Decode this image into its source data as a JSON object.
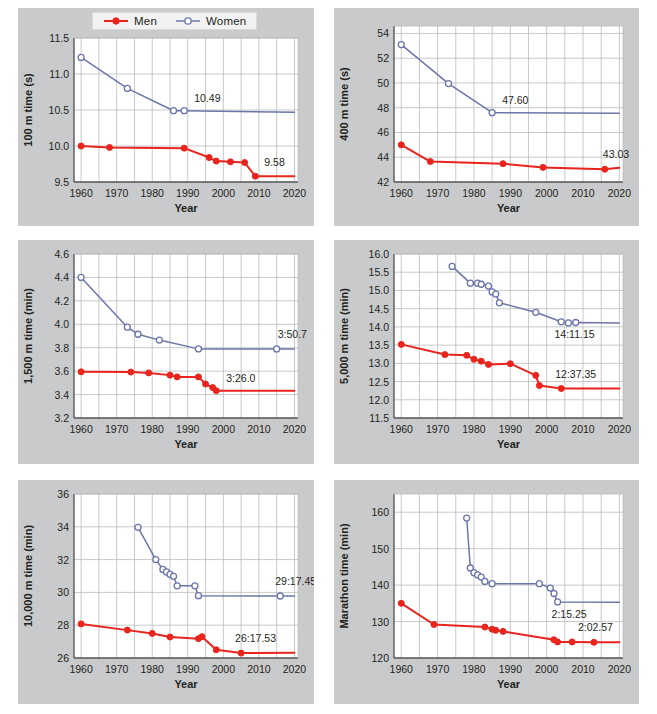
{
  "legend": {
    "men_label": "Men",
    "women_label": "Women",
    "men_color": "#e8241c",
    "women_color": "#6b76a8"
  },
  "common": {
    "xlabel": "Year",
    "xticks": [
      1960,
      1970,
      1980,
      1990,
      2000,
      2010,
      2020
    ],
    "xlim": [
      1958,
      2021
    ]
  },
  "chart_data": [
    {
      "id": "p100m",
      "type": "line",
      "title": "",
      "xlabel": "Year",
      "ylabel": "100 m time (s)",
      "xlim": [
        1958,
        2021
      ],
      "ylim": [
        9.5,
        11.5
      ],
      "yticks": [
        9.5,
        10.0,
        10.5,
        11.0,
        11.5
      ],
      "ytick_labels": [
        "9.5",
        "10.0",
        "10.5",
        "11.0",
        "11.5"
      ],
      "grid": true,
      "legend_position": "top-center",
      "annotations": [
        {
          "series": "Women",
          "text": "10.49",
          "x": 1989,
          "y": 10.49,
          "dx": 10,
          "dy": -9
        },
        {
          "series": "Men",
          "text": "9.58",
          "x": 2009,
          "y": 9.58,
          "dx": 9,
          "dy": -10
        }
      ],
      "series": [
        {
          "name": "Men",
          "color": "#e8241c",
          "marker": "filled-circle",
          "points": [
            [
              1960,
              10.0
            ],
            [
              1968,
              9.98
            ],
            [
              1989,
              9.97
            ],
            [
              1996,
              9.84
            ],
            [
              1998,
              9.79
            ],
            [
              2002,
              9.78
            ],
            [
              2006,
              9.77
            ],
            [
              2009,
              9.58
            ],
            [
              2020,
              9.58
            ]
          ]
        },
        {
          "name": "Women",
          "color": "#6b76a8",
          "marker": "open-circle",
          "points": [
            [
              1960,
              11.23
            ],
            [
              1973,
              10.8
            ],
            [
              1986,
              10.49
            ],
            [
              1989,
              10.49
            ],
            [
              2020,
              10.47
            ]
          ]
        }
      ]
    },
    {
      "id": "p400m",
      "type": "line",
      "title": "",
      "xlabel": "Year",
      "ylabel": "400 m time (s)",
      "xlim": [
        1958,
        2021
      ],
      "ylim": [
        42,
        54.6
      ],
      "yticks": [
        42,
        44,
        46,
        48,
        50,
        52,
        54
      ],
      "ytick_labels": [
        "42",
        "44",
        "46",
        "48",
        "50",
        "52",
        "54"
      ],
      "grid": true,
      "legend_position": "none",
      "annotations": [
        {
          "series": "Women",
          "text": "47.60",
          "x": 1985,
          "y": 47.6,
          "dx": 10,
          "dy": -9
        },
        {
          "series": "Men",
          "text": "43.03",
          "x": 2016,
          "y": 43.03,
          "dx": -2,
          "dy": -11
        }
      ],
      "series": [
        {
          "name": "Men",
          "color": "#e8241c",
          "marker": "filled-circle",
          "points": [
            [
              1960,
              45.0
            ],
            [
              1968,
              43.65
            ],
            [
              1988,
              43.48
            ],
            [
              1999,
              43.18
            ],
            [
              2016,
              43.03
            ],
            [
              2020,
              43.15
            ]
          ]
        },
        {
          "name": "Women",
          "color": "#6b76a8",
          "marker": "open-circle",
          "points": [
            [
              1960,
              53.1
            ],
            [
              1973,
              49.95
            ],
            [
              1985,
              47.6
            ],
            [
              2020,
              47.55
            ]
          ]
        }
      ]
    },
    {
      "id": "p1500m",
      "type": "line",
      "title": "",
      "xlabel": "Year",
      "ylabel": "1,500 m time (min)",
      "xlim": [
        1958,
        2021
      ],
      "ylim": [
        3.2,
        4.6
      ],
      "yticks": [
        3.2,
        3.4,
        3.6,
        3.8,
        4.0,
        4.2,
        4.4,
        4.6
      ],
      "ytick_labels": [
        "3.2",
        "3.4",
        "3.6",
        "3.8",
        "4.0",
        "4.2",
        "4.4",
        "4.6"
      ],
      "grid": true,
      "legend_position": "none",
      "annotations": [
        {
          "series": "Men",
          "text": "3:26.0",
          "x": 1998,
          "y": 3.46,
          "dx": 10,
          "dy": -6
        },
        {
          "series": "Women",
          "text": "3:50.7",
          "x": 2015,
          "y": 3.79,
          "dx": 1,
          "dy": -11
        }
      ],
      "series": [
        {
          "name": "Men",
          "color": "#e8241c",
          "marker": "filled-circle",
          "points": [
            [
              1960,
              3.594
            ],
            [
              1974,
              3.592
            ],
            [
              1979,
              3.585
            ],
            [
              1985,
              3.566
            ],
            [
              1987,
              3.551
            ],
            [
              1993,
              3.551
            ],
            [
              1995,
              3.49
            ],
            [
              1997,
              3.46
            ],
            [
              1998,
              3.433
            ],
            [
              2020,
              3.433
            ]
          ]
        },
        {
          "name": "Women",
          "color": "#6b76a8",
          "marker": "open-circle",
          "points": [
            [
              1960,
              4.4
            ],
            [
              1973,
              3.975
            ],
            [
              1976,
              3.915
            ],
            [
              1982,
              3.865
            ],
            [
              1993,
              3.79
            ],
            [
              2015,
              3.79
            ],
            [
              2020,
              3.79
            ]
          ]
        }
      ]
    },
    {
      "id": "p5000m",
      "type": "line",
      "title": "",
      "xlabel": "Year",
      "ylabel": "5,000 m time (min)",
      "xlim": [
        1958,
        2021
      ],
      "ylim": [
        11.5,
        16.0
      ],
      "yticks": [
        11.5,
        12.0,
        12.5,
        13.0,
        13.5,
        14.0,
        14.5,
        15.0,
        15.5,
        16.0
      ],
      "ytick_labels": [
        "11.5",
        "12.0",
        "12.5",
        "13.0",
        "13.5",
        "14.0",
        "14.5",
        "15.0",
        "15.5",
        "16.0"
      ],
      "grid": true,
      "legend_position": "none",
      "annotations": [
        {
          "series": "Women",
          "text": "14:11.15",
          "x": 2006,
          "y": 14.12,
          "dx": -14,
          "dy": 15
        },
        {
          "series": "Men",
          "text": "12:37.35",
          "x": 2004,
          "y": 12.32,
          "dx": -6,
          "dy": -10
        }
      ],
      "series": [
        {
          "name": "Men",
          "color": "#e8241c",
          "marker": "filled-circle",
          "points": [
            [
              1960,
              13.52
            ],
            [
              1972,
              13.24
            ],
            [
              1978,
              13.22
            ],
            [
              1980,
              13.11
            ],
            [
              1982,
              13.06
            ],
            [
              1984,
              12.97
            ],
            [
              1990,
              12.99
            ],
            [
              1997,
              12.67
            ],
            [
              1998,
              12.39
            ],
            [
              2004,
              12.31
            ],
            [
              2020,
              12.31
            ]
          ]
        },
        {
          "name": "Women",
          "color": "#6b76a8",
          "marker": "open-circle",
          "points": [
            [
              1974,
              15.66
            ],
            [
              1979,
              15.2
            ],
            [
              1981,
              15.2
            ],
            [
              1982,
              15.17
            ],
            [
              1984,
              15.12
            ],
            [
              1985,
              14.96
            ],
            [
              1986,
              14.9
            ],
            [
              1987,
              14.66
            ],
            [
              1997,
              14.4
            ],
            [
              2004,
              14.14
            ],
            [
              2006,
              14.11
            ],
            [
              2008,
              14.12
            ],
            [
              2020,
              14.11
            ]
          ]
        }
      ]
    },
    {
      "id": "p10000m",
      "type": "line",
      "title": "",
      "xlabel": "Year",
      "ylabel": "10,000 m time (min)",
      "xlim": [
        1958,
        2021
      ],
      "ylim": [
        26,
        36
      ],
      "yticks": [
        26,
        28,
        30,
        32,
        34,
        36
      ],
      "ytick_labels": [
        "26",
        "28",
        "30",
        "32",
        "34",
        "36"
      ],
      "grid": true,
      "legend_position": "none",
      "annotations": [
        {
          "series": "Women",
          "text": "29:17.45",
          "x": 2016,
          "y": 29.78,
          "dx": -5,
          "dy": -11
        },
        {
          "series": "Men",
          "text": "26:17.53",
          "x": 2005,
          "y": 26.3,
          "dx": -6,
          "dy": -11
        }
      ],
      "series": [
        {
          "name": "Men",
          "color": "#e8241c",
          "marker": "filled-circle",
          "points": [
            [
              1960,
              28.08
            ],
            [
              1973,
              27.7
            ],
            [
              1980,
              27.5
            ],
            [
              1985,
              27.28
            ],
            [
              1993,
              27.18
            ],
            [
              1994,
              27.3
            ],
            [
              1998,
              26.5
            ],
            [
              2005,
              26.3
            ],
            [
              2020,
              26.32
            ]
          ]
        },
        {
          "name": "Women",
          "color": "#6b76a8",
          "marker": "open-circle",
          "points": [
            [
              1976,
              33.97
            ],
            [
              1981,
              32.0
            ],
            [
              1983,
              31.4
            ],
            [
              1984,
              31.25
            ],
            [
              1985,
              31.1
            ],
            [
              1986,
              30.98
            ],
            [
              1987,
              30.4
            ],
            [
              1992,
              30.4
            ],
            [
              1993,
              29.8
            ],
            [
              2016,
              29.78
            ],
            [
              2020,
              29.78
            ]
          ]
        }
      ]
    },
    {
      "id": "pmarathon",
      "type": "line",
      "title": "",
      "xlabel": "Year",
      "ylabel": "Marathon time (min)",
      "xlim": [
        1958,
        2021
      ],
      "ylim": [
        120,
        165
      ],
      "yticks": [
        120,
        130,
        140,
        150,
        160
      ],
      "ytick_labels": [
        "120",
        "130",
        "140",
        "150",
        "160"
      ],
      "grid": true,
      "legend_position": "none",
      "annotations": [
        {
          "series": "Women",
          "text": "2:15.25",
          "x": 2003,
          "y": 135.4,
          "dx": -6,
          "dy": 16
        },
        {
          "series": "Men",
          "text": "2:02.57",
          "x": 2013,
          "y": 124.3,
          "dx": -16,
          "dy": -11
        }
      ],
      "series": [
        {
          "name": "Men",
          "color": "#e8241c",
          "marker": "filled-circle",
          "points": [
            [
              1960,
              135.0
            ],
            [
              1969,
              129.2
            ],
            [
              1983,
              128.5
            ],
            [
              1985,
              127.9
            ],
            [
              1986,
              127.6
            ],
            [
              1988,
              127.3
            ],
            [
              2002,
              125.0
            ],
            [
              2003,
              124.4
            ],
            [
              2007,
              124.4
            ],
            [
              2013,
              124.3
            ],
            [
              2020,
              124.3
            ]
          ]
        },
        {
          "name": "Women",
          "color": "#6b76a8",
          "marker": "open-circle",
          "points": [
            [
              1978,
              158.4
            ],
            [
              1979,
              144.7
            ],
            [
              1980,
              143.4
            ],
            [
              1981,
              142.8
            ],
            [
              1982,
              142.2
            ],
            [
              1983,
              141.0
            ],
            [
              1985,
              140.4
            ],
            [
              1998,
              140.4
            ],
            [
              2001,
              139.2
            ],
            [
              2002,
              137.7
            ],
            [
              2003,
              135.4
            ],
            [
              2020,
              135.3
            ]
          ]
        }
      ]
    }
  ]
}
